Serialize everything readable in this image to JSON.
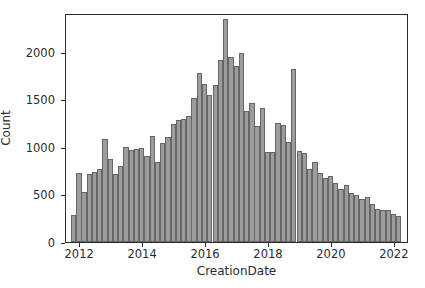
{
  "chart_data": {
    "type": "bar",
    "title": "",
    "subtitle": "",
    "xlabel": "CreationDate",
    "ylabel": "Count",
    "xlim": [
      2011.55,
      2022.45
    ],
    "ylim": [
      0,
      2410
    ],
    "grid": false,
    "legend": null,
    "bin_width_years": 0.1667,
    "bar_fill_color": "#9c9c9c",
    "bar_edge_color": "#666666",
    "axis_color": "#2b2b2b",
    "background_color": "#ffffff",
    "xticks": [
      2012,
      2014,
      2016,
      2018,
      2020,
      2022
    ],
    "xtick_labels": [
      "2012",
      "2014",
      "2016",
      "2018",
      "2020",
      "2022"
    ],
    "yticks": [
      0,
      500,
      1000,
      1500,
      2000
    ],
    "ytick_labels": [
      "0",
      "500",
      "1000",
      "1500",
      "2000"
    ],
    "x": [
      2011.79,
      2011.96,
      2012.12,
      2012.29,
      2012.46,
      2012.62,
      2012.79,
      2012.96,
      2013.12,
      2013.29,
      2013.46,
      2013.62,
      2013.79,
      2013.96,
      2014.12,
      2014.29,
      2014.46,
      2014.62,
      2014.79,
      2014.96,
      2015.12,
      2015.29,
      2015.46,
      2015.62,
      2015.79,
      2015.96,
      2016.12,
      2016.29,
      2016.46,
      2016.62,
      2016.79,
      2016.96,
      2017.12,
      2017.29,
      2017.46,
      2017.62,
      2017.79,
      2017.96,
      2018.12,
      2018.29,
      2018.46,
      2018.62,
      2018.79,
      2018.96,
      2019.12,
      2019.29,
      2019.46,
      2019.62,
      2019.79,
      2019.96,
      2020.12,
      2020.29,
      2020.46,
      2020.62,
      2020.79,
      2020.96,
      2021.12,
      2021.29,
      2021.46,
      2021.62,
      2021.79,
      2021.96,
      2022.12
    ],
    "values": [
      280,
      725,
      525,
      720,
      735,
      765,
      1085,
      875,
      720,
      805,
      1000,
      965,
      980,
      985,
      910,
      1120,
      840,
      1045,
      1110,
      1240,
      1285,
      1290,
      1330,
      1515,
      1775,
      1660,
      1545,
      1655,
      1920,
      2345,
      1950,
      1855,
      1985,
      1375,
      1465,
      1220,
      1415,
      950,
      945,
      1250,
      1230,
      1050,
      1825,
      955,
      935,
      770,
      840,
      725,
      675,
      690,
      620,
      555,
      595,
      520,
      490,
      455,
      475,
      395,
      345,
      340,
      335,
      300,
      270
    ],
    "annotations": [
      {
        "label": "peak",
        "x": 2016.62,
        "y": 2345
      },
      {
        "label": "secondary-spike",
        "x": 2018.79,
        "y": 1825
      }
    ]
  },
  "axes": {
    "x_title": "CreationDate",
    "y_title": "Count"
  }
}
